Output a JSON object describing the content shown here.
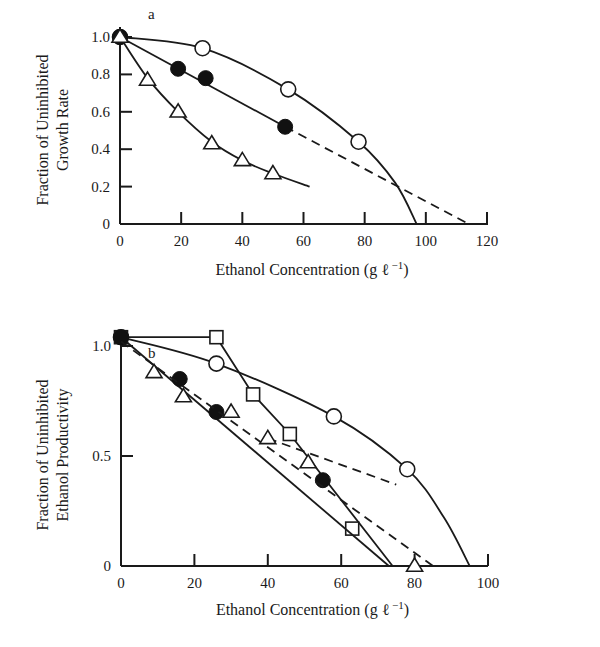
{
  "chart_data": [
    {
      "type": "line",
      "panel": "a",
      "xlabel": "Ethanol Concentration (g ℓ⁻¹)",
      "ylabel": "Fraction of Uninhibited Growth Rate",
      "ylabel_lines": [
        "Fraction of Uninhibited",
        "Growth Rate"
      ],
      "xlim": [
        0,
        120
      ],
      "ylim": [
        0,
        1.0
      ],
      "xticks": [
        0,
        20,
        40,
        60,
        80,
        100,
        120
      ],
      "yticks": [
        0,
        0.2,
        0.4,
        0.6,
        0.8,
        1.0
      ],
      "ytick_labels": [
        "0",
        "0.2",
        "0.4",
        "0.6",
        "0.8",
        "1.0"
      ],
      "grid": false,
      "series": [
        {
          "name": "open circles",
          "marker": "open-circle",
          "x": [
            0,
            27,
            55,
            78
          ],
          "y": [
            1.0,
            0.94,
            0.72,
            0.44
          ],
          "fit_x": [
            0,
            27,
            55,
            78,
            90,
            97
          ],
          "fit_y": [
            1.0,
            0.94,
            0.72,
            0.44,
            0.22,
            0.0
          ],
          "fit_style": "solid"
        },
        {
          "name": "filled circles",
          "marker": "filled-circle",
          "x": [
            0,
            19,
            28,
            54
          ],
          "y": [
            1.0,
            0.83,
            0.78,
            0.52
          ],
          "fit_x": [
            0,
            54
          ],
          "fit_y": [
            1.0,
            0.52
          ],
          "fit_style": "solid",
          "extrap_x": [
            54,
            114
          ],
          "extrap_y": [
            0.52,
            0.0
          ],
          "extrap_style": "dashed"
        },
        {
          "name": "triangles",
          "marker": "open-triangle",
          "x": [
            0,
            9,
            19,
            30,
            40,
            50
          ],
          "y": [
            1.0,
            0.77,
            0.6,
            0.43,
            0.34,
            0.27
          ],
          "fit_x": [
            0,
            9,
            19,
            30,
            40,
            50,
            62
          ],
          "fit_y": [
            1.0,
            0.78,
            0.6,
            0.44,
            0.34,
            0.27,
            0.2
          ],
          "fit_style": "solid"
        }
      ]
    },
    {
      "type": "line",
      "panel": "b",
      "xlabel": "Ethanol Concentration (g ℓ⁻¹)",
      "ylabel": "Fraction of Uninhibited Ethanol Productivity",
      "ylabel_lines": [
        "Fraction of Uninhibited",
        "Ethanol Productivity"
      ],
      "xlim": [
        0,
        100
      ],
      "ylim": [
        0,
        1.0
      ],
      "xticks": [
        0,
        20,
        40,
        60,
        80,
        100
      ],
      "yticks": [
        0,
        0.5,
        1.0
      ],
      "ytick_labels": [
        "0",
        "0.5",
        "1.0"
      ],
      "grid": false,
      "series": [
        {
          "name": "squares",
          "marker": "open-square",
          "x": [
            0,
            26,
            36,
            46,
            63
          ],
          "y": [
            1.04,
            1.04,
            0.78,
            0.6,
            0.17
          ],
          "fit_x": [
            0,
            26,
            36,
            46,
            74
          ],
          "fit_y": [
            1.04,
            1.04,
            0.78,
            0.6,
            0.0
          ],
          "fit_style": "solid"
        },
        {
          "name": "open circles",
          "marker": "open-circle",
          "x": [
            0,
            26,
            58,
            78
          ],
          "y": [
            1.04,
            0.92,
            0.68,
            0.44
          ],
          "fit_x": [
            0,
            26,
            58,
            78,
            88,
            95
          ],
          "fit_y": [
            1.04,
            0.92,
            0.68,
            0.44,
            0.22,
            0.0
          ],
          "fit_style": "solid"
        },
        {
          "name": "filled circles",
          "marker": "filled-circle",
          "x": [
            0,
            16,
            26,
            55
          ],
          "y": [
            1.04,
            0.85,
            0.7,
            0.39
          ],
          "fit_x": [
            0,
            73
          ],
          "fit_y": [
            1.04,
            0.0
          ],
          "fit_style": "solid"
        },
        {
          "name": "triangles",
          "marker": "open-triangle",
          "x": [
            9,
            17,
            30,
            40,
            51,
            80
          ],
          "y": [
            0.88,
            0.77,
            0.7,
            0.58,
            0.47,
            0.0
          ],
          "fit_x": [
            0,
            85
          ],
          "fit_y": [
            1.02,
            0.0
          ],
          "fit_style": "dashed",
          "branch_x": [
            40,
            75
          ],
          "branch_y": [
            0.58,
            0.37
          ],
          "branch_style": "dashed"
        }
      ]
    }
  ],
  "panels": {
    "a": {
      "letter": "a",
      "xlabel": "Ethanol Concentration (g ℓ",
      "xlabel_sup": "−1",
      "xlabel_close": ")"
    },
    "b": {
      "letter": "b",
      "xlabel": "Ethanol Concentration (g ℓ",
      "xlabel_sup": "−1",
      "xlabel_close": ")"
    }
  }
}
